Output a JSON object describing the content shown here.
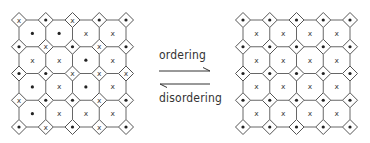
{
  "diagram": {
    "colors": {
      "line": "#555555",
      "dot": "#222222",
      "x_mark": "#444444",
      "background": "#ffffff"
    },
    "symbols": {
      "dot": "•",
      "x": "x"
    },
    "grid": {
      "nodes_per_side": 5,
      "spacing": 26.75,
      "diamond_half": 7.5
    },
    "left_lattice": {
      "name": "disordered",
      "origin": [
        19,
        20
      ],
      "diamond_sites": [
        [
          "x",
          "dot",
          "x",
          "dot",
          "dot"
        ],
        [
          "dot",
          "x",
          "dot",
          "x",
          "dot"
        ],
        [
          "dot",
          "dot",
          "x",
          "x",
          "x"
        ],
        [
          "x",
          "dot",
          "dot",
          "x",
          "dot"
        ],
        [
          "dot",
          "x",
          "dot",
          "x",
          "dot"
        ]
      ],
      "octagon_sites": [
        [
          "dot",
          "dot",
          "x",
          "x"
        ],
        [
          "x",
          "x",
          "dot",
          "x"
        ],
        [
          "dot",
          "x",
          "dot",
          "x"
        ],
        [
          "dot",
          "x",
          "x",
          "x"
        ]
      ]
    },
    "right_lattice": {
      "name": "ordered",
      "origin": [
        243,
        20
      ],
      "diamond_sites": [
        [
          "dot",
          "dot",
          "dot",
          "dot",
          "dot"
        ],
        [
          "dot",
          "dot",
          "dot",
          "dot",
          "dot"
        ],
        [
          "dot",
          "dot",
          "dot",
          "dot",
          "dot"
        ],
        [
          "dot",
          "dot",
          "dot",
          "dot",
          "dot"
        ],
        [
          "dot",
          "dot",
          "dot",
          "dot",
          "dot"
        ]
      ],
      "octagon_sites": [
        [
          "x",
          "x",
          "x",
          "x"
        ],
        [
          "x",
          "x",
          "x",
          "x"
        ],
        [
          "x",
          "x",
          "x",
          "x"
        ],
        [
          "x",
          "x",
          "x",
          "x"
        ]
      ]
    },
    "arrows": {
      "forward": {
        "label": "ordering",
        "direction": "right",
        "icon": "harpoon-right-icon",
        "y": 71,
        "x1": 159,
        "x2": 210
      },
      "reverse": {
        "label": "disordering",
        "direction": "left",
        "icon": "harpoon-left-icon",
        "y": 84,
        "x1": 160,
        "x2": 210
      }
    }
  }
}
